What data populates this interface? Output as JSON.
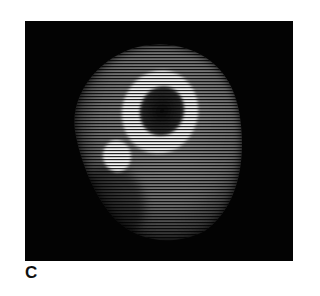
{
  "figure": {
    "panel_label": "C",
    "image_description": "CT cross-section of lower leg showing tibia ring and fibula",
    "colors": {
      "background": "#030303",
      "tissue": "#8a8a8a",
      "bone": "#f0f0f0",
      "marrow": "#1a1a1a",
      "page": "#ffffff"
    }
  }
}
